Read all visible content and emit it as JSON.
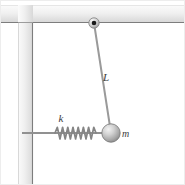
{
  "figure": {
    "background_color": "#ffffff",
    "width": 185,
    "height": 185
  },
  "labels": {
    "rod_length": "L",
    "spring_constant": "k",
    "mass": "m"
  },
  "colors": {
    "wall_fill_light": "#f4f4f4",
    "wall_fill_mid": "#e3e3e3",
    "wall_edge": "#7d7d7d",
    "rod": "#9a9a9a",
    "spring": "#858585",
    "ball_light": "#e8e8e8",
    "ball_dark": "#8a8a8a",
    "label_text": "#3b3b3b",
    "pivot_dot": "#1a1a1a"
  },
  "geometry": {
    "ceiling": {
      "x": 0,
      "y": 5,
      "width": 185,
      "height": 18
    },
    "vertical_wall": {
      "x": 18,
      "y": 23,
      "width": 15,
      "height": 162
    },
    "pivot": {
      "cx": 94,
      "cy": 23,
      "r": 5,
      "dot_r": 2.2
    },
    "rod": {
      "x1": 94,
      "y1": 23,
      "x2": 111,
      "y2": 133
    },
    "rod_label_pos": {
      "x": 108,
      "y": 80
    },
    "support_line": {
      "x1": 22,
      "y1": 133,
      "x2": 111,
      "y2": 133
    },
    "spring": {
      "x_start": 55,
      "x_end": 96,
      "y": 133,
      "coils": 8,
      "amplitude": 6
    },
    "spring_label_pos": {
      "x": 60,
      "y": 122
    },
    "mass_ball": {
      "cx": 111,
      "cy": 133,
      "r": 9
    },
    "mass_label_pos": {
      "x": 123,
      "y": 137
    }
  },
  "icons": {
    "pivot": "pivot-joint-icon",
    "spring": "coil-spring-icon",
    "mass": "sphere-mass-icon",
    "wall": "fixed-wall-icon"
  }
}
